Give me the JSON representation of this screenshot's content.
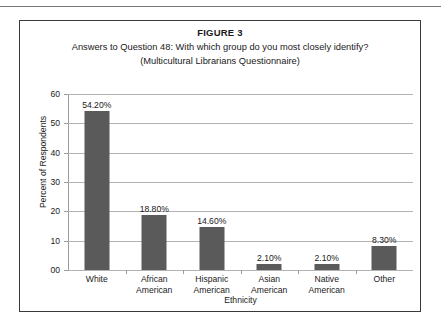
{
  "figure": {
    "number_label": "FIGURE 3",
    "caption_line_1": "Answers to Question 48: With which group do you most closely identify?",
    "caption_line_2": "(Multicultural Librarians Questionnaire)"
  },
  "colors": {
    "bar_fill": "#5a5a5a",
    "gridline": "#b3b3b3",
    "axis_line": "#9a9a9a",
    "frame_border": "#3a3a3a",
    "text": "#1a1a1a"
  },
  "chart_data": {
    "type": "bar",
    "title": "Answers to Question 48: With which group do you most closely identify?",
    "subtitle": "(Multicultural Librarians Questionnaire)",
    "xlabel": "Ethnicity",
    "ylabel": "Percent of Respondents",
    "ylim": [
      0,
      60
    ],
    "ytick_labels": [
      "60",
      "50",
      "40",
      "30",
      "20",
      "10",
      "00"
    ],
    "ytick_values": [
      60,
      50,
      40,
      30,
      20,
      10,
      0
    ],
    "grid": true,
    "legend": false,
    "categories": [
      "White",
      "African American",
      "Hispanic American",
      "Asian American",
      "Native American",
      "Other"
    ],
    "category_lines": [
      [
        "White"
      ],
      [
        "African",
        "American"
      ],
      [
        "Hispanic",
        "American"
      ],
      [
        "Asian",
        "American"
      ],
      [
        "Native",
        "American"
      ],
      [
        "Other"
      ]
    ],
    "values": [
      54.2,
      18.8,
      14.6,
      2.1,
      2.1,
      8.3
    ],
    "data_labels": [
      "54.20%",
      "18.80%",
      "14.60%",
      "2.10%",
      "2.10%",
      "8.30%"
    ]
  }
}
